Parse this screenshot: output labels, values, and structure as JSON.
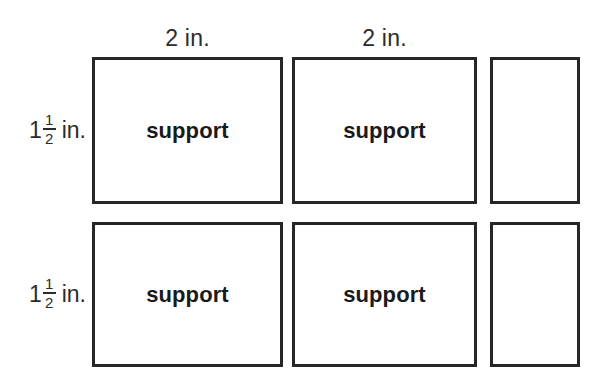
{
  "diagram": {
    "type": "labeled-rectangle-grid",
    "background_color": "#ffffff",
    "line_color": "#262626",
    "text_color": "#1a1a1a",
    "column_labels": [
      {
        "text": "2 in.",
        "value": "2",
        "unit": "in."
      },
      {
        "text": "2 in.",
        "value": "2",
        "unit": "in."
      }
    ],
    "row_labels": [
      {
        "whole": "1",
        "numerator": "1",
        "denominator": "2",
        "unit": "in."
      },
      {
        "whole": "1",
        "numerator": "1",
        "denominator": "2",
        "unit": "in."
      }
    ],
    "cells": [
      {
        "label": "support"
      },
      {
        "label": "support"
      },
      {
        "label": ""
      },
      {
        "label": "support"
      },
      {
        "label": "support"
      },
      {
        "label": ""
      }
    ]
  }
}
